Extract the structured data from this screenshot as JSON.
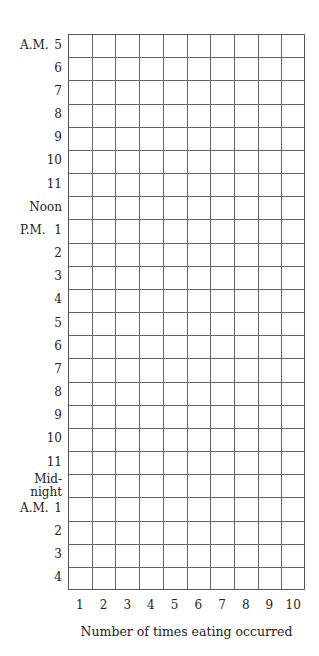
{
  "chart_data": {
    "type": "table",
    "title": "",
    "xlabel": "Number of times eating occurred",
    "ylabel": "",
    "x_ticks": [
      "1",
      "2",
      "3",
      "4",
      "5",
      "6",
      "7",
      "8",
      "9",
      "10"
    ],
    "y_ticks": [
      {
        "prefix": "A.M.",
        "label": "5"
      },
      {
        "prefix": "",
        "label": "6"
      },
      {
        "prefix": "",
        "label": "7"
      },
      {
        "prefix": "",
        "label": "8"
      },
      {
        "prefix": "",
        "label": "9"
      },
      {
        "prefix": "",
        "label": "10"
      },
      {
        "prefix": "",
        "label": "11"
      },
      {
        "prefix": "",
        "label": "Noon"
      },
      {
        "prefix": "P.M.",
        "label": "1"
      },
      {
        "prefix": "",
        "label": "2"
      },
      {
        "prefix": "",
        "label": "3"
      },
      {
        "prefix": "",
        "label": "4"
      },
      {
        "prefix": "",
        "label": "5"
      },
      {
        "prefix": "",
        "label": "6"
      },
      {
        "prefix": "",
        "label": "7"
      },
      {
        "prefix": "",
        "label": "8"
      },
      {
        "prefix": "",
        "label": "9"
      },
      {
        "prefix": "",
        "label": "10"
      },
      {
        "prefix": "",
        "label": "11"
      },
      {
        "prefix": "",
        "label": "Mid-\nnight"
      },
      {
        "prefix": "A.M.",
        "label": "1"
      },
      {
        "prefix": "",
        "label": "2"
      },
      {
        "prefix": "",
        "label": "3"
      },
      {
        "prefix": "",
        "label": "4"
      }
    ],
    "rows": 24,
    "columns": 10,
    "values": [],
    "grid": true,
    "legend": null
  }
}
